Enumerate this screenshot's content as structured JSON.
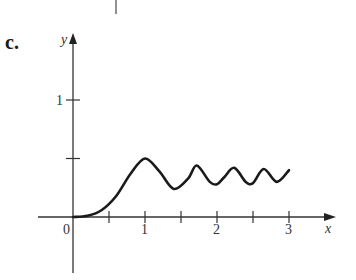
{
  "figure": {
    "panel_label": "c."
  },
  "chart_data": {
    "type": "line",
    "title": "",
    "xlabel": "x",
    "ylabel": "y",
    "xlim": [
      0,
      3
    ],
    "ylim": [
      0,
      1
    ],
    "x_ticks": [
      0.5,
      1,
      1.5,
      2,
      2.5,
      3
    ],
    "x_tick_labels": [
      "0",
      "1",
      "2",
      "3"
    ],
    "y_ticks": [
      0.5,
      1
    ],
    "y_tick_labels": [
      "1"
    ],
    "grid": false,
    "legend": null,
    "series": [
      {
        "name": "curve",
        "x": [
          0,
          0.2,
          0.4,
          0.6,
          0.8,
          1.0,
          1.2,
          1.4,
          1.6,
          1.72,
          1.9,
          2.0,
          2.1,
          2.24,
          2.4,
          2.5,
          2.65,
          2.83,
          3.0
        ],
        "y": [
          0,
          0.01,
          0.06,
          0.18,
          0.37,
          0.5,
          0.39,
          0.24,
          0.33,
          0.44,
          0.3,
          0.28,
          0.34,
          0.42,
          0.3,
          0.29,
          0.41,
          0.3,
          0.4
        ]
      }
    ]
  }
}
